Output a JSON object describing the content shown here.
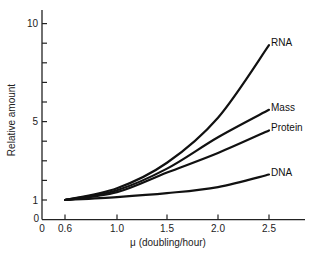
{
  "chart_data": {
    "type": "line",
    "title": "",
    "xlabel": "μ (doubling/hour)",
    "ylabel": "Relative amount",
    "x_ticks": [
      0,
      0.6,
      1.0,
      1.5,
      2.0,
      2.5
    ],
    "x_tick_labels": [
      "0",
      "0.6",
      "1.0",
      "1.5",
      "2.0",
      "2.5"
    ],
    "y_ticks": [
      0,
      1,
      2,
      3,
      4,
      5,
      6,
      7,
      8,
      9,
      10
    ],
    "y_tick_labels": [
      "0",
      "1",
      "",
      "",
      "",
      "5",
      "",
      "",
      "",
      "",
      "10"
    ],
    "xlim": [
      0,
      2.85
    ],
    "ylim": [
      0,
      10.5
    ],
    "grid": false,
    "legend": "inline labels at line ends",
    "x": [
      0.6,
      1.0,
      1.5,
      2.0,
      2.5
    ],
    "series": [
      {
        "name": "RNA",
        "values": [
          1.0,
          1.6,
          2.9,
          5.2,
          8.9
        ]
      },
      {
        "name": "Mass",
        "values": [
          1.0,
          1.5,
          2.6,
          4.2,
          5.6
        ]
      },
      {
        "name": "Protein",
        "values": [
          1.0,
          1.4,
          2.4,
          3.4,
          4.55
        ]
      },
      {
        "name": "DNA",
        "values": [
          1.0,
          1.15,
          1.35,
          1.66,
          2.3
        ]
      }
    ]
  },
  "layout": {
    "x_px": {
      "0": 42,
      "0.6": 65,
      "1.0": 117,
      "1.5": 167,
      "2.0": 218,
      "2.5": 269
    },
    "x_axis_end": 305,
    "y_px_per_unit": 19.6,
    "y_zero_px": 219.6
  }
}
